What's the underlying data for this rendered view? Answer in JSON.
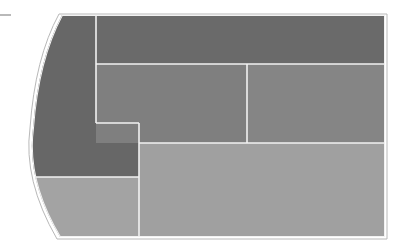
{
  "diagram": {
    "type": "treemap-blocks",
    "outline_color": "#b8b8b8",
    "divider_color": "#f2f2f2",
    "tick_color": "#8a8a8a",
    "regions": [
      {
        "id": "top-band",
        "label": "",
        "color": "#6a6a6a"
      },
      {
        "id": "left-column",
        "label": "",
        "color": "#676767"
      },
      {
        "id": "middle-left",
        "label": "",
        "color": "#7f7f7f"
      },
      {
        "id": "middle-right",
        "label": "",
        "color": "#858585"
      },
      {
        "id": "bottom-right",
        "label": "",
        "color": "#a0a0a0"
      },
      {
        "id": "bottom-left",
        "label": "",
        "color": "#a3a3a3"
      }
    ]
  }
}
